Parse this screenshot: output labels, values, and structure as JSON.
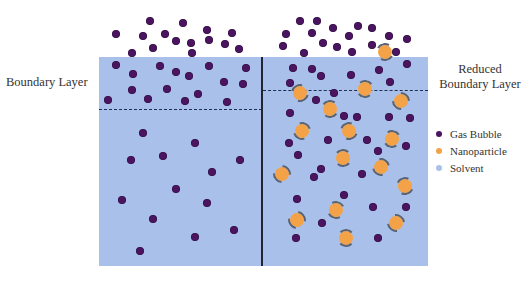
{
  "labels": {
    "left": "Boundary Layer",
    "right_line1": "Reduced",
    "right_line2": "Boundary Layer"
  },
  "legend": [
    {
      "label": "Gas Bubble",
      "color": "#4a1460"
    },
    {
      "label": "Nanoparticle",
      "color": "#f4a248"
    },
    {
      "label": "Solvent",
      "color": "#a9c0ea"
    }
  ],
  "colors": {
    "solvent": "#a9c0ea",
    "gas_bubble": "#4a1460",
    "nanoparticle": "#f4a248",
    "divider": "#1f2533"
  },
  "boundary_lines": {
    "left_y": 109,
    "right_y": 90
  },
  "gas_bubbles_left": [
    [
      116,
      34
    ],
    [
      150,
      21
    ],
    [
      143,
      36
    ],
    [
      183,
      23
    ],
    [
      165,
      34
    ],
    [
      207,
      30
    ],
    [
      232,
      33
    ],
    [
      153,
      48
    ],
    [
      176,
      41
    ],
    [
      191,
      43
    ],
    [
      209,
      40
    ],
    [
      225,
      44
    ],
    [
      239,
      49
    ],
    [
      132,
      53
    ],
    [
      192,
      53
    ],
    [
      116,
      65
    ],
    [
      133,
      74
    ],
    [
      160,
      66
    ],
    [
      176,
      72
    ],
    [
      189,
      76
    ],
    [
      209,
      66
    ],
    [
      246,
      68
    ],
    [
      224,
      82
    ],
    [
      243,
      84
    ],
    [
      108,
      100
    ],
    [
      132,
      90
    ],
    [
      167,
      89
    ],
    [
      148,
      99
    ],
    [
      185,
      101
    ],
    [
      198,
      94
    ],
    [
      227,
      102
    ],
    [
      143,
      133
    ],
    [
      195,
      143
    ],
    [
      131,
      160
    ],
    [
      163,
      156
    ],
    [
      240,
      160
    ],
    [
      212,
      172
    ],
    [
      176,
      189
    ],
    [
      122,
      200
    ],
    [
      207,
      203
    ],
    [
      153,
      219
    ],
    [
      234,
      230
    ],
    [
      195,
      237
    ],
    [
      140,
      251
    ]
  ],
  "gas_bubbles_right": [
    [
      300,
      21
    ],
    [
      317,
      21
    ],
    [
      333,
      28
    ],
    [
      358,
      26
    ],
    [
      372,
      28
    ],
    [
      286,
      34
    ],
    [
      312,
      33
    ],
    [
      349,
      36
    ],
    [
      389,
      36
    ],
    [
      407,
      39
    ],
    [
      283,
      46
    ],
    [
      323,
      43
    ],
    [
      337,
      47
    ],
    [
      372,
      45
    ],
    [
      304,
      53
    ],
    [
      352,
      52
    ],
    [
      396,
      52
    ],
    [
      293,
      68
    ],
    [
      312,
      69
    ],
    [
      321,
      76
    ],
    [
      351,
      75
    ],
    [
      379,
      70
    ],
    [
      407,
      64
    ],
    [
      290,
      83
    ],
    [
      390,
      82
    ],
    [
      334,
      93
    ],
    [
      316,
      100
    ],
    [
      290,
      113
    ],
    [
      344,
      116
    ],
    [
      357,
      117
    ],
    [
      389,
      117
    ],
    [
      410,
      118
    ],
    [
      328,
      140
    ],
    [
      367,
      140
    ],
    [
      406,
      146
    ],
    [
      289,
      143
    ],
    [
      298,
      155
    ],
    [
      378,
      151
    ],
    [
      321,
      169
    ],
    [
      314,
      177
    ],
    [
      362,
      174
    ],
    [
      344,
      195
    ],
    [
      297,
      199
    ],
    [
      373,
      207
    ],
    [
      406,
      207
    ],
    [
      322,
      223
    ],
    [
      296,
      238
    ],
    [
      378,
      238
    ]
  ],
  "nanoparticles_right": [
    [
      300,
      93
    ],
    [
      365,
      89
    ],
    [
      401,
      101
    ],
    [
      330,
      109
    ],
    [
      302,
      131
    ],
    [
      349,
      131
    ],
    [
      392,
      139
    ],
    [
      282,
      174
    ],
    [
      343,
      158
    ],
    [
      381,
      167
    ],
    [
      405,
      186
    ],
    [
      336,
      210
    ],
    [
      297,
      220
    ],
    [
      346,
      238
    ],
    [
      396,
      223
    ],
    [
      385,
      52
    ]
  ]
}
